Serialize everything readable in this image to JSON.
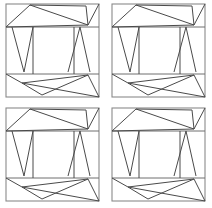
{
  "figure": {
    "background_color": "#ffffff",
    "line_color": "#4a4a4a",
    "border_color": "#8a8a8a",
    "divider_color": "#6f6f6f",
    "panel_count": 4,
    "grid_columns": 2,
    "grid_rows": 2,
    "panels": [
      {
        "label": "panel-top-left",
        "row": 1,
        "column": 1
      },
      {
        "label": "panel-top-right",
        "row": 1,
        "column": 2
      },
      {
        "label": "panel-bottom-left",
        "row": 2,
        "column": 1
      },
      {
        "label": "panel-bottom-right",
        "row": 2,
        "column": 2
      }
    ]
  },
  "chart_data": {
    "type": "diagram",
    "xlabel": "",
    "ylabel": "",
    "grid": false,
    "legend": "none",
    "panel_box": {
      "x": 6,
      "y": 4,
      "width": 93,
      "height": 93
    },
    "bands": {
      "top_band_y": [
        4,
        27
      ],
      "middle_band_y": [
        27,
        74
      ],
      "bottom_band_y": [
        74,
        97
      ]
    },
    "vertices": {
      "outer": [
        [
          6,
          4
        ],
        [
          99,
          4
        ],
        [
          99,
          97
        ],
        [
          6,
          97
        ]
      ],
      "top_band_left": [
        6,
        27
      ],
      "top_band_right": [
        99,
        27
      ],
      "top_apex": [
        30,
        5
      ],
      "top_right_node": [
        86,
        6
      ],
      "top_convergence": [
        88,
        25
      ],
      "bottom_band_left": [
        6,
        74
      ],
      "bottom_band_right": [
        99,
        74
      ],
      "bottom_convergence": [
        22,
        83
      ],
      "bottom_apex": [
        42,
        95
      ],
      "bottom_right_node": [
        88,
        75
      ],
      "middle_left_v": [
        [
          12,
          27
        ],
        [
          24,
          72
        ],
        [
          33,
          27
        ]
      ],
      "middle_right_lambda": [
        [
          68,
          72
        ],
        [
          80,
          27
        ],
        [
          90,
          72
        ]
      ],
      "middle_vertical_left": [
        [
          33,
          27
        ],
        [
          33,
          74
        ]
      ],
      "middle_vertical_right": [
        [
          74,
          27
        ],
        [
          74,
          74
        ]
      ]
    },
    "segments": [
      {
        "name": "outer-rectangle",
        "points": [
          [
            6,
            4
          ],
          [
            99,
            4
          ],
          [
            99,
            97
          ],
          [
            6,
            97
          ],
          [
            6,
            4
          ]
        ]
      },
      {
        "name": "top-band-divider",
        "points": [
          [
            6,
            27
          ],
          [
            99,
            27
          ]
        ]
      },
      {
        "name": "bottom-band-divider",
        "points": [
          [
            6,
            74
          ],
          [
            99,
            74
          ]
        ]
      },
      {
        "name": "top-tri-a",
        "points": [
          [
            6,
            27
          ],
          [
            30,
            5
          ]
        ]
      },
      {
        "name": "top-tri-b",
        "points": [
          [
            30,
            5
          ],
          [
            88,
            25
          ]
        ]
      },
      {
        "name": "top-tri-c",
        "points": [
          [
            6,
            27
          ],
          [
            88,
            25
          ]
        ]
      },
      {
        "name": "top-tri-d",
        "points": [
          [
            30,
            5
          ],
          [
            86,
            6
          ]
        ]
      },
      {
        "name": "top-tri-e",
        "points": [
          [
            86,
            6
          ],
          [
            88,
            25
          ]
        ]
      },
      {
        "name": "top-tri-f",
        "points": [
          [
            99,
            4
          ],
          [
            88,
            25
          ]
        ]
      },
      {
        "name": "mid-v-left-down",
        "points": [
          [
            12,
            27
          ],
          [
            24,
            72
          ]
        ]
      },
      {
        "name": "mid-v-left-up",
        "points": [
          [
            24,
            72
          ],
          [
            33,
            27
          ]
        ]
      },
      {
        "name": "mid-vertical-left",
        "points": [
          [
            33,
            27
          ],
          [
            33,
            74
          ]
        ]
      },
      {
        "name": "mid-vertical-right",
        "points": [
          [
            74,
            27
          ],
          [
            74,
            74
          ]
        ]
      },
      {
        "name": "mid-lambda-left",
        "points": [
          [
            68,
            72
          ],
          [
            80,
            27
          ]
        ]
      },
      {
        "name": "mid-lambda-right",
        "points": [
          [
            80,
            27
          ],
          [
            90,
            72
          ]
        ]
      },
      {
        "name": "bot-tri-a",
        "points": [
          [
            6,
            74
          ],
          [
            22,
            83
          ]
        ]
      },
      {
        "name": "bot-tri-b",
        "points": [
          [
            22,
            83
          ],
          [
            88,
            75
          ]
        ]
      },
      {
        "name": "bot-tri-c",
        "points": [
          [
            22,
            83
          ],
          [
            42,
            95
          ]
        ]
      },
      {
        "name": "bot-tri-d",
        "points": [
          [
            42,
            95
          ],
          [
            88,
            75
          ]
        ]
      },
      {
        "name": "bot-tri-e",
        "points": [
          [
            88,
            75
          ],
          [
            99,
            97
          ]
        ]
      },
      {
        "name": "bot-tri-f",
        "points": [
          [
            22,
            83
          ],
          [
            99,
            97
          ]
        ]
      }
    ]
  }
}
